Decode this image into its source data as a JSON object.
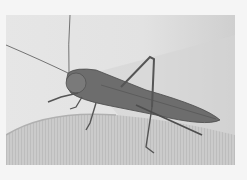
{
  "image": {
    "subject": "grasshopper on fabric",
    "alt": "Black and white photo of a long-horned grasshopper resting on a knitted fabric surface",
    "colors": {
      "border": "#f5f5f5",
      "background_light": "#ececec",
      "fabric": "#c8c8c8",
      "insect": "#6a6a6a",
      "insect_dark": "#4a4a4a"
    }
  }
}
